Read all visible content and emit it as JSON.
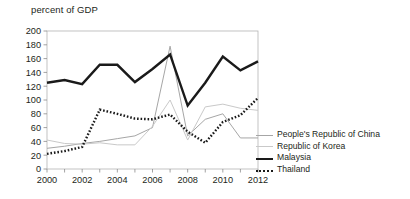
{
  "axis_title": "percent of GDP",
  "colors": {
    "prc": "#a6a6a6",
    "kor": "#c9c9c9",
    "mys": "#1a1a1a",
    "tha": "#1a1a1a",
    "frame": "#b3b3b3",
    "tick": "#8c8c8c",
    "text": "#231f20"
  },
  "legend": {
    "items": [
      {
        "label": "People's Republic of China",
        "key": "prc",
        "style": "thin-gray",
        "swatch_name": "legend-swatch-prc"
      },
      {
        "label": "Republic of Korea",
        "key": "kor",
        "style": "thin-lightgray",
        "swatch_name": "legend-swatch-kor"
      },
      {
        "label": "Malaysia",
        "key": "mys",
        "style": "thick-black",
        "swatch_name": "legend-swatch-mys"
      },
      {
        "label": "Thailand",
        "key": "tha",
        "style": "dotted-black",
        "swatch_name": "legend-swatch-tha"
      }
    ]
  },
  "chart_data": {
    "type": "line",
    "title": "",
    "subtitle": "",
    "xlabel": "",
    "ylabel": "percent of GDP",
    "ylim": [
      0,
      200
    ],
    "xlim": [
      2000,
      2012
    ],
    "grid": false,
    "legend_position": "right",
    "y_ticks": [
      0,
      20,
      40,
      60,
      80,
      100,
      120,
      140,
      160,
      180,
      200
    ],
    "x_ticks": [
      2000,
      2002,
      2004,
      2006,
      2008,
      2010,
      2012
    ],
    "x_minor_ticks": [
      2001,
      2003,
      2005,
      2007,
      2009,
      2011
    ],
    "x": [
      2000,
      2001,
      2002,
      2003,
      2004,
      2005,
      2006,
      2007,
      2008,
      2009,
      2010,
      2011,
      2012
    ],
    "series": [
      {
        "name": "People's Republic of China",
        "key": "prc",
        "color": "#a6a6a6",
        "values": [
          30,
          33,
          37,
          40,
          44,
          48,
          60,
          178,
          48,
          72,
          80,
          45,
          45
        ]
      },
      {
        "name": "Republic of Korea",
        "key": "kor",
        "color": "#c9c9c9",
        "values": [
          42,
          37,
          36,
          38,
          35,
          35,
          62,
          100,
          42,
          90,
          94,
          88,
          85
        ]
      },
      {
        "name": "Malaysia",
        "key": "mys",
        "color": "#1a1a1a",
        "values": [
          125,
          129,
          123,
          151,
          151,
          126,
          145,
          166,
          92,
          125,
          163,
          143,
          156
        ]
      },
      {
        "name": "Thailand",
        "key": "tha",
        "color": "#1a1a1a",
        "values": [
          22,
          26,
          32,
          86,
          80,
          73,
          72,
          79,
          54,
          38,
          68,
          78,
          103
        ]
      }
    ]
  }
}
